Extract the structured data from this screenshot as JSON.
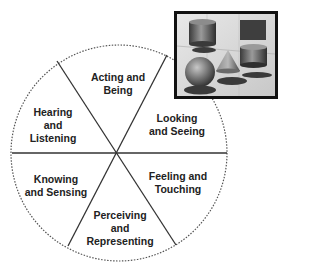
{
  "diagram": {
    "type": "segmented-circle",
    "center": [
      119,
      153
    ],
    "radius": 108,
    "divider_color": "#333333",
    "outline_style": "dotted",
    "segments": [
      {
        "id": "acting",
        "lines": [
          "Acting and",
          "Being"
        ],
        "pos": [
          118,
          71
        ]
      },
      {
        "id": "looking",
        "lines": [
          "Looking",
          "and Seeing"
        ],
        "pos": [
          177,
          112
        ]
      },
      {
        "id": "feeling",
        "lines": [
          "Feeling and",
          "Touching"
        ],
        "pos": [
          178,
          170
        ]
      },
      {
        "id": "perceiving",
        "lines": [
          "Perceiving",
          "and",
          "Representing"
        ],
        "pos": [
          119,
          209
        ]
      },
      {
        "id": "knowing",
        "lines": [
          "Knowing",
          "and Sensing"
        ],
        "pos": [
          53,
          173
        ]
      },
      {
        "id": "hearing",
        "lines": [
          "Hearing",
          "and",
          "Listening"
        ],
        "pos": [
          53,
          106
        ]
      }
    ]
  },
  "inset": {
    "description": "3D geometric shapes image: cylinders, cube, sphere, cone with cast shadows",
    "border_color": "#111111",
    "background": "#dcdcdc"
  }
}
